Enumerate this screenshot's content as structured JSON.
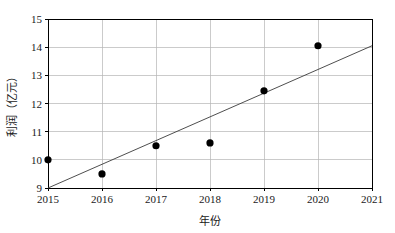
{
  "chart_data": {
    "type": "scatter",
    "title": "",
    "subtitle": "",
    "xlabel": "年份",
    "ylabel": "利润（亿元）",
    "xlim": [
      2015,
      2021
    ],
    "ylim": [
      9,
      15
    ],
    "grid": true,
    "legend": "none",
    "x_tick_labels": [
      "2015",
      "2016",
      "2017",
      "2018",
      "2019",
      "2020",
      "2021"
    ],
    "y_tick_labels": [
      "9",
      "10",
      "11",
      "12",
      "13",
      "14",
      "15"
    ],
    "x": [
      2015,
      2016,
      2017,
      2018,
      2019,
      2020
    ],
    "values": [
      10.0,
      9.5,
      10.5,
      10.6,
      12.45,
      14.05
    ],
    "series": [
      {
        "name": "利润",
        "type": "scatter",
        "marker": "filled-circle",
        "color": "#000000",
        "points": [
          {
            "x": 2015,
            "y": 10.0
          },
          {
            "x": 2016,
            "y": 9.5
          },
          {
            "x": 2017,
            "y": 10.5
          },
          {
            "x": 2018,
            "y": 10.6
          },
          {
            "x": 2019,
            "y": 12.45
          },
          {
            "x": 2020,
            "y": 14.05
          }
        ]
      },
      {
        "name": "趋势线",
        "type": "line",
        "color": "#3a3a3a",
        "endpoints": [
          {
            "x": 2015,
            "y": 9.0
          },
          {
            "x": 2021,
            "y": 14.05
          }
        ]
      }
    ],
    "annotations": []
  },
  "axes": {
    "x_title": "年份",
    "y_title": "利润（亿元）"
  }
}
